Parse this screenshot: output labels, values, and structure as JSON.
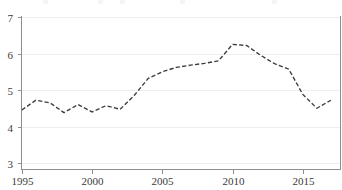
{
  "chart_data": {
    "type": "line",
    "title": "",
    "subtitle": "",
    "xlabel": "",
    "ylabel": "",
    "xlim": [
      1994.4,
      1994.4
    ],
    "ylim": [
      3,
      7
    ],
    "grid": true,
    "grid_axis": "y",
    "legend": false,
    "legend_position": "none",
    "line_style": "dashed",
    "line_color": "#3a3a42",
    "x_tick_labels": [
      "1995",
      "2000",
      "2005",
      "2010",
      "2015"
    ],
    "x_ticks": [
      1995,
      2000,
      2005,
      2010,
      2015
    ],
    "y_tick_labels": [
      "3",
      "4",
      "5",
      "6",
      "7"
    ],
    "y_ticks": [
      3,
      4,
      5,
      6,
      7
    ],
    "x": [
      1995,
      1996,
      1997,
      1998,
      1999,
      2000,
      2001,
      2002,
      2003,
      2004,
      2005,
      2006,
      2007,
      2008,
      2009,
      2010,
      2011,
      2012,
      2013,
      2014,
      2015,
      2016,
      2017
    ],
    "values": [
      4.45,
      4.72,
      4.65,
      4.38,
      4.6,
      4.4,
      4.57,
      4.47,
      4.85,
      5.32,
      5.5,
      5.62,
      5.68,
      5.73,
      5.8,
      6.25,
      6.22,
      5.95,
      5.72,
      5.57,
      4.88,
      4.5,
      4.72
    ],
    "series": [
      {
        "name": "series-1",
        "values": [
          4.45,
          4.72,
          4.65,
          4.38,
          4.6,
          4.4,
          4.57,
          4.47,
          4.85,
          5.32,
          5.5,
          5.62,
          5.68,
          5.73,
          5.8,
          6.25,
          6.22,
          5.95,
          5.72,
          5.57,
          4.88,
          4.5,
          4.72
        ]
      }
    ]
  },
  "axes": {
    "y_axis_name": "y-axis",
    "x_axis_name": "x-axis"
  },
  "colors": {
    "line": "#3a3a42",
    "grid": "#ededf2",
    "axis": "#8d8d92",
    "text": "#3b3b3b",
    "background": "#ffffff"
  }
}
